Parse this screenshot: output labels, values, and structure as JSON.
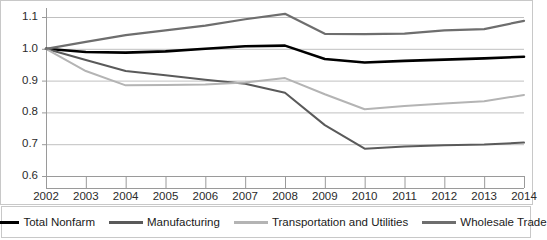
{
  "chart_data": {
    "type": "line",
    "title": "",
    "subtitle": "",
    "xlabel": "",
    "ylabel": "",
    "categories": [
      "2002",
      "2003",
      "2004",
      "2005",
      "2006",
      "2007",
      "2008",
      "2009",
      "2010",
      "2011",
      "2012",
      "2013",
      "2014"
    ],
    "x": [
      2002,
      2003,
      2004,
      2005,
      2006,
      2007,
      2008,
      2009,
      2010,
      2011,
      2012,
      2013,
      2014
    ],
    "ylim": [
      0.6,
      1.1
    ],
    "yticks": [
      0.6,
      0.7,
      0.8,
      0.9,
      1.0,
      1.1
    ],
    "ytick_labels": [
      "0.6",
      "0.7",
      "0.8",
      "0.9",
      "1.0",
      "1.1"
    ],
    "grid": true,
    "grid_axis": "y",
    "legend_position": "bottom",
    "series": [
      {
        "name": "Total Nonfarm",
        "color": "#000000",
        "width": 2.6,
        "values": [
          1.0,
          0.99,
          0.988,
          0.992,
          1.0,
          1.008,
          1.01,
          0.968,
          0.957,
          0.962,
          0.966,
          0.97,
          0.975
        ]
      },
      {
        "name": "Manufacturing",
        "color": "#5a5a5a",
        "width": 2.0,
        "values": [
          1.0,
          0.965,
          0.93,
          0.917,
          0.903,
          0.89,
          0.862,
          0.76,
          0.686,
          0.693,
          0.697,
          0.699,
          0.705
        ]
      },
      {
        "name": "Transportation and Utilities",
        "color": "#b4b4b4",
        "width": 2.0,
        "values": [
          1.0,
          0.93,
          0.885,
          0.886,
          0.888,
          0.894,
          0.908,
          0.857,
          0.81,
          0.82,
          0.828,
          0.835,
          0.855
        ]
      },
      {
        "name": "Wholesale Trade",
        "color": "#6e6e6e",
        "width": 2.2,
        "values": [
          1.0,
          1.022,
          1.043,
          1.058,
          1.073,
          1.093,
          1.11,
          1.047,
          1.046,
          1.048,
          1.058,
          1.062,
          1.088
        ]
      }
    ]
  },
  "legend": {
    "items": [
      {
        "label": "Total Nonfarm"
      },
      {
        "label": "Manufacturing"
      },
      {
        "label": "Transportation and Utilities"
      },
      {
        "label": "Wholesale Trade"
      }
    ]
  },
  "axes": {
    "y_tick_labels": [
      "1.1",
      "1.0",
      "0.9",
      "0.8",
      "0.7",
      "0.6"
    ],
    "x_tick_labels": [
      "2002",
      "2003",
      "2004",
      "2005",
      "2006",
      "2007",
      "2008",
      "2009",
      "2010",
      "2011",
      "2012",
      "2013",
      "2014"
    ]
  }
}
